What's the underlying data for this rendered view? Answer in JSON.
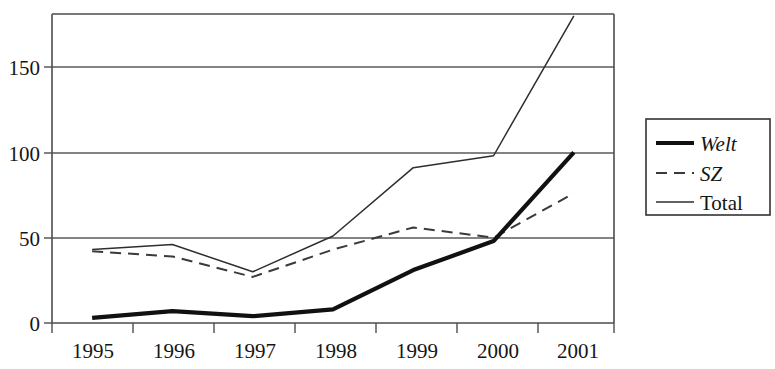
{
  "chart_data": {
    "type": "line",
    "title": "",
    "subtitle": "",
    "xlabel": "",
    "ylabel": "",
    "categories": [
      "1995",
      "1996",
      "1997",
      "1998",
      "1999",
      "2000",
      "2001"
    ],
    "ylim": [
      0,
      181
    ],
    "yticks": [
      0,
      50,
      100,
      150
    ],
    "ytick_labels": [
      "0",
      "50",
      "100",
      "150"
    ],
    "grid": "horizontal",
    "legend_position": "right-outside",
    "series": [
      {
        "name": "Welt",
        "style": "thick-solid",
        "italic": true,
        "color": "#111111",
        "values": [
          3,
          7,
          4,
          8,
          31,
          48,
          100
        ]
      },
      {
        "name": "SZ",
        "style": "dashed",
        "italic": true,
        "color": "#3a3a3a",
        "values": [
          42,
          39,
          27,
          43,
          56,
          50,
          76
        ]
      },
      {
        "name": "Total",
        "style": "thin-solid",
        "italic": false,
        "color": "#2e2e2e",
        "values": [
          43,
          46,
          30,
          51,
          91,
          98,
          180
        ]
      }
    ]
  },
  "legend": {
    "entries": [
      {
        "label": "Welt"
      },
      {
        "label": "SZ"
      },
      {
        "label": "Total"
      }
    ]
  },
  "axes": {
    "y_labels": [
      "150",
      "100",
      "50",
      "0"
    ],
    "x_labels": [
      "1995",
      "1996",
      "1997",
      "1998",
      "1999",
      "2000",
      "2001"
    ]
  },
  "colors": {
    "background": "#ffffff",
    "frame": "#4d4d4d",
    "grid": "#5a5a5a",
    "text": "#151515",
    "welt": "#111111",
    "sz": "#3a3a3a",
    "total": "#2e2e2e"
  }
}
